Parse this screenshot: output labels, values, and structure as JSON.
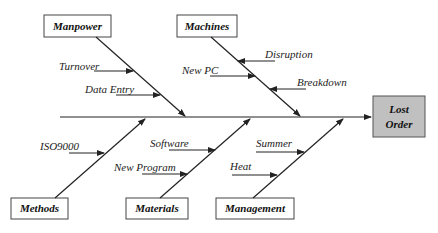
{
  "diagram": {
    "type": "fishbone",
    "effect": {
      "line1": "Lost",
      "line2": "Order",
      "fill": "#c0c0c0"
    },
    "categories": [
      {
        "id": "manpower",
        "label": "Manpower",
        "position": "top",
        "causes": [
          "Turnover",
          "Data Entry"
        ]
      },
      {
        "id": "machines",
        "label": "Machines",
        "position": "top",
        "causes": [
          "Disruption",
          "New PC",
          "Breakdown"
        ]
      },
      {
        "id": "methods",
        "label": "Methods",
        "position": "bottom",
        "causes": [
          "ISO9000"
        ]
      },
      {
        "id": "materials",
        "label": "Materials",
        "position": "bottom",
        "causes": [
          "Software",
          "New Program"
        ]
      },
      {
        "id": "management",
        "label": "Management",
        "position": "bottom",
        "causes": [
          "Summer",
          "Heat"
        ]
      }
    ]
  }
}
